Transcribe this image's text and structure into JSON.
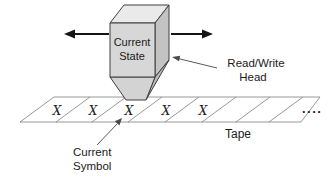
{
  "diagram": {
    "title_semantic": "Turing machine read/write head over tape",
    "head_box": {
      "label_line1": "Current",
      "label_line2": "State"
    },
    "annotations": {
      "read_write_head_line1": "Read/Write",
      "read_write_head_line2": "Head",
      "tape_label": "Tape",
      "current_symbol_line1": "Current",
      "current_symbol_line2": "Symbol",
      "ellipsis": "...."
    },
    "tape": {
      "current_cell_index": 2,
      "cells": [
        {
          "symbol": "X"
        },
        {
          "symbol": "X"
        },
        {
          "symbol": "X"
        },
        {
          "symbol": "X"
        },
        {
          "symbol": "X"
        },
        {
          "symbol": ""
        },
        {
          "symbol": ""
        },
        {
          "symbol": ""
        }
      ]
    },
    "colors": {
      "background": "#ffffff",
      "box_front": "#d7d7d7",
      "box_top": "#eaeaea",
      "box_right": "#c3c3c3",
      "funnel_front": "#d3d3d3",
      "funnel_right": "#b9b9b9",
      "outline": "#3f3f3f",
      "tape_line": "#8c8c8c",
      "text": "#1a1a1a"
    }
  }
}
